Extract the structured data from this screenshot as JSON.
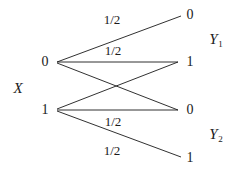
{
  "figure": {
    "type": "channel-transition-diagram",
    "background": "#ffffff",
    "stroke_color": "#1a1a1a",
    "width": 243,
    "height": 175
  },
  "input": {
    "name": "X",
    "nodes": [
      {
        "label": "0",
        "x": 45,
        "y": 62
      },
      {
        "label": "1",
        "x": 45,
        "y": 110
      }
    ]
  },
  "outputs": {
    "groups": [
      {
        "name": "Y",
        "subscript": "1",
        "x": 216,
        "y": 40
      },
      {
        "name": "Y",
        "subscript": "2",
        "x": 216,
        "y": 135
      }
    ],
    "nodes": [
      {
        "label": "0",
        "x": 190,
        "y": 15
      },
      {
        "label": "1",
        "x": 190,
        "y": 62
      },
      {
        "label": "0",
        "x": 190,
        "y": 110
      },
      {
        "label": "1",
        "x": 190,
        "y": 158
      }
    ]
  },
  "x_label": {
    "text": "X",
    "x": 18,
    "y": 88
  },
  "edges": [
    {
      "from": "0",
      "to": "0",
      "x1": 57,
      "y1": 62,
      "x2": 181,
      "y2": 16,
      "probability": "1/2"
    },
    {
      "from": "0",
      "to": "1",
      "x1": 57,
      "y1": 62,
      "x2": 178,
      "y2": 62,
      "probability": "1/2"
    },
    {
      "from": "0",
      "to": "0b",
      "x1": 57,
      "y1": 63,
      "x2": 178,
      "y2": 110,
      "probability": ""
    },
    {
      "from": "1",
      "to": "1t",
      "x1": 57,
      "y1": 109,
      "x2": 178,
      "y2": 62,
      "probability": ""
    },
    {
      "from": "1",
      "to": "0b",
      "x1": 57,
      "y1": 110,
      "x2": 178,
      "y2": 110,
      "probability": "1/2"
    },
    {
      "from": "1",
      "to": "1b",
      "x1": 57,
      "y1": 111,
      "x2": 181,
      "y2": 157,
      "probability": "1/2"
    }
  ],
  "edge_labels": [
    {
      "text": "1/2",
      "x": 112,
      "y": 19
    },
    {
      "text": "1/2",
      "x": 113,
      "y": 50
    },
    {
      "text": "1/2",
      "x": 113,
      "y": 121
    },
    {
      "text": "1/2",
      "x": 112,
      "y": 150
    }
  ]
}
